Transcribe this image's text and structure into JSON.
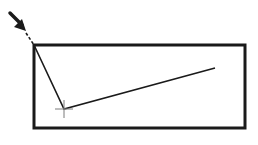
{
  "diagram": {
    "type": "polyline-in-rectangle",
    "colors": {
      "background": "#ffffff",
      "stroke": "#1a1a1a",
      "crosshair": "#7a7a7a"
    },
    "rectangle": {
      "x": 34,
      "y": 45,
      "width": 211,
      "height": 83,
      "stroke_width": 3
    },
    "arrow": {
      "tip": [
        26,
        31
      ],
      "tail": [
        9,
        12
      ],
      "direction": "down-right"
    },
    "pointer_line": {
      "from": [
        26,
        33
      ],
      "to": [
        34,
        45
      ],
      "style": "dashed"
    },
    "polyline": {
      "points": [
        [
          34,
          45
        ],
        [
          64,
          109
        ],
        [
          215,
          68
        ]
      ],
      "stroke_width": 1.6
    },
    "crosshair": {
      "center": [
        64,
        109
      ],
      "size": 9
    }
  }
}
